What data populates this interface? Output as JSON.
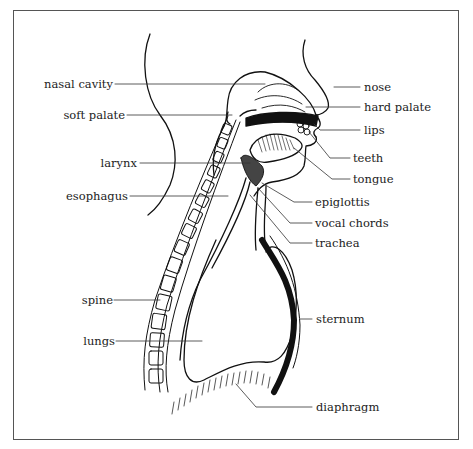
{
  "diagram": {
    "colors": {
      "line": "#111111",
      "leader": "#333333",
      "frame": "#555555",
      "background": "#ffffff"
    },
    "labels_left": [
      {
        "id": "nasal-cavity",
        "text": "nasal cavity"
      },
      {
        "id": "soft-palate",
        "text": "soft palate"
      },
      {
        "id": "larynx",
        "text": "larynx"
      },
      {
        "id": "esophagus",
        "text": "esophagus"
      },
      {
        "id": "spine",
        "text": "spine"
      },
      {
        "id": "lungs",
        "text": "lungs"
      }
    ],
    "labels_right": [
      {
        "id": "nose",
        "text": "nose"
      },
      {
        "id": "hard-palate",
        "text": "hard palate"
      },
      {
        "id": "lips",
        "text": "lips"
      },
      {
        "id": "teeth",
        "text": "teeth"
      },
      {
        "id": "tongue",
        "text": "tongue"
      },
      {
        "id": "epiglottis",
        "text": "epiglottis"
      },
      {
        "id": "vocal-chords",
        "text": "vocal chords"
      },
      {
        "id": "trachea",
        "text": "trachea"
      },
      {
        "id": "sternum",
        "text": "sternum"
      },
      {
        "id": "diaphragm",
        "text": "diaphragm"
      }
    ]
  }
}
